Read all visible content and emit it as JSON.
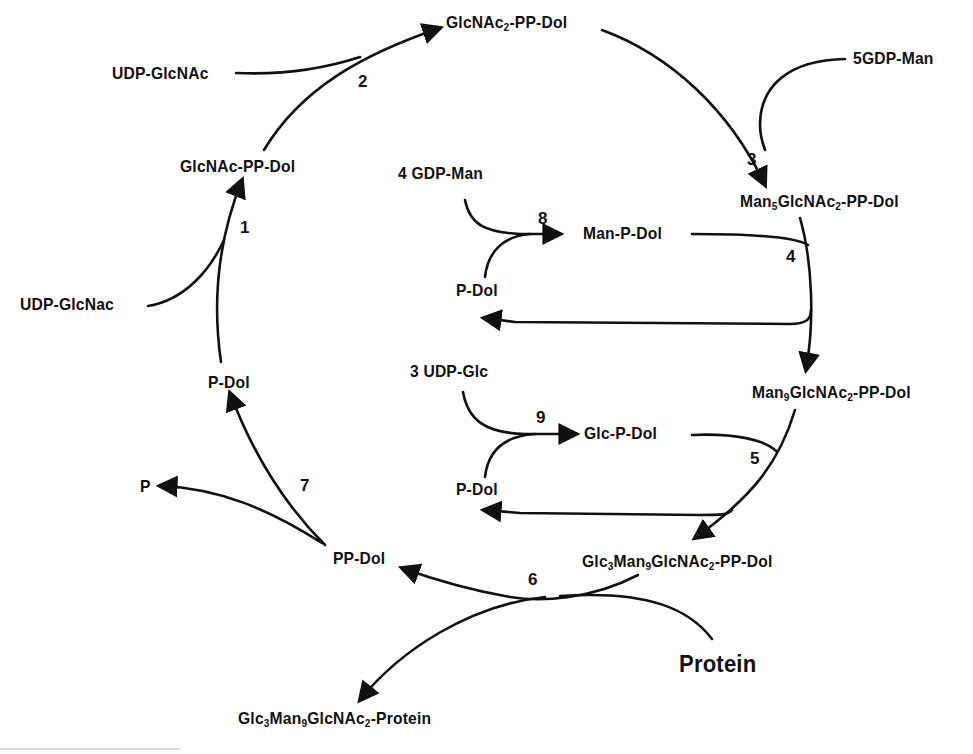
{
  "diagram": {
    "compounds": {
      "glcnac2_pp_dol": {
        "base": "GlcNAc",
        "sub": "2",
        "rest": "-PP-Dol"
      },
      "udp_glcnac_top": "UDP-GlcNAc",
      "glcnac_pp_dol": "GlcNAc-PP-Dol",
      "udp_glcnac_left": "UDP-GlcNac",
      "five_gdp_man": "5GDP-Man",
      "man5": {
        "a": "Man",
        "a_sub": "5",
        "b": "GlcNAc",
        "b_sub": "2",
        "rest": "-PP-Dol"
      },
      "four_gdp_man": "4 GDP-Man",
      "man_p_dol": "Man-P-Dol",
      "p_dol_inner_top": "P-Dol",
      "man9": {
        "a": "Man",
        "a_sub": "9",
        "b": "GlcNAc",
        "b_sub": "2",
        "rest": "-PP-Dol"
      },
      "three_udp_glc": "3 UDP-Glc",
      "glc_p_dol": "Glc-P-Dol",
      "p_dol_inner_bottom": "P-Dol",
      "p_dol_left": "P-Dol",
      "p": "P",
      "pp_dol": "PP-Dol",
      "glc3man9": {
        "a": "Glc",
        "a_sub": "3",
        "b": "Man",
        "b_sub": "9",
        "c": "GlcNAc",
        "c_sub": "2",
        "rest": "-PP-Dol"
      },
      "protein": "Protein",
      "glycoprotein": {
        "a": "Glc",
        "a_sub": "3",
        "b": "Man",
        "b_sub": "9",
        "c": "GlcNAc",
        "c_sub": "2",
        "rest": "-Protein"
      }
    },
    "step_numbers": [
      "1",
      "2",
      "3",
      "4",
      "5",
      "6",
      "7",
      "8",
      "9"
    ],
    "colors": {
      "ink": "#111111",
      "background": "#ffffff"
    }
  }
}
